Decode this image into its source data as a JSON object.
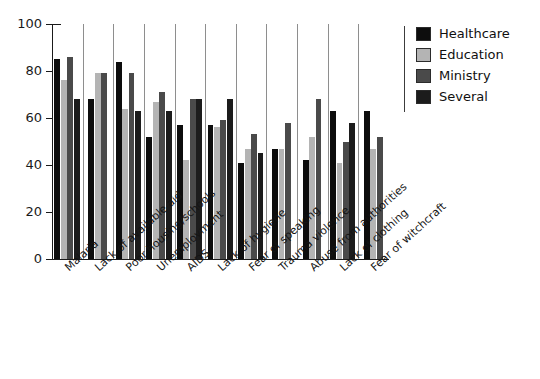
{
  "chart_data": {
    "type": "bar",
    "title": "",
    "xlabel": "",
    "ylabel": "",
    "ylim": [
      0,
      100
    ],
    "ytick_values": [
      0,
      20,
      40,
      60,
      80,
      100
    ],
    "ytick_labels": [
      "0",
      "20",
      "40",
      "60",
      "80",
      "100"
    ],
    "grid": false,
    "group_separators": true,
    "legend_position": "right",
    "categories": [
      "Malaria",
      "Lack of available aid",
      "Poor housing/schools",
      "Unemployment",
      "AIDS",
      "Lack of hygiene",
      "Fear of speaking",
      "Trauma violence",
      "Abuse from authorities",
      "Lack of clothing",
      "Fear of witchcraft"
    ],
    "series": [
      {
        "name": "Healthcare",
        "color": "#0d0d0d",
        "values": [
          85,
          68,
          84,
          52,
          57,
          57,
          41,
          47,
          42,
          63,
          63
        ]
      },
      {
        "name": "Education",
        "color": "#b4b4b4",
        "values": [
          76,
          79,
          64,
          67,
          42,
          56,
          47,
          47,
          52,
          41,
          47
        ]
      },
      {
        "name": "Ministry",
        "color": "#4a4a4a",
        "values": [
          86,
          79,
          79,
          71,
          68,
          59,
          53,
          58,
          68,
          50,
          52
        ]
      },
      {
        "name": "Several",
        "color": "#1c1c1c",
        "values": [
          68,
          null,
          63,
          63,
          68,
          68,
          45,
          null,
          null,
          58,
          null
        ]
      }
    ]
  },
  "legend": {
    "items": [
      {
        "label": "Healthcare",
        "color": "#0d0d0d"
      },
      {
        "label": "Education",
        "color": "#b4b4b4"
      },
      {
        "label": "Ministry",
        "color": "#4a4a4a"
      },
      {
        "label": "Several",
        "color": "#1c1c1c"
      }
    ]
  },
  "axis": {
    "y_labels": [
      "100",
      "80",
      "60",
      "40",
      "20",
      "0"
    ]
  }
}
